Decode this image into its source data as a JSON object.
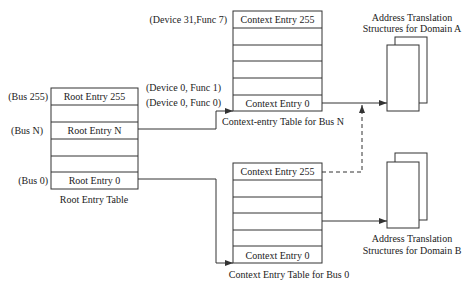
{
  "root_table": {
    "caption": "Root Entry Table",
    "entries": [
      "Root Entry 255",
      "",
      "Root Entry N",
      "",
      "",
      "Root Entry 0"
    ],
    "bus_labels": {
      "top": "(Bus 255)",
      "mid": "(Bus N)",
      "bottom": "(Bus 0)"
    }
  },
  "context_table_n": {
    "caption": "Context-entry Table for Bus N",
    "entries": [
      "Context Entry 255",
      "",
      "",
      "",
      "",
      "Context Entry 0"
    ],
    "device_labels": {
      "top": "(Device 31,Func 7)",
      "func1": "(Device 0, Func 1)",
      "func0": "(Device 0, Func 0)"
    }
  },
  "context_table_0": {
    "caption": "Context Entry Table for Bus 0",
    "entries": [
      "Context Entry 255",
      "",
      "",
      "",
      "",
      "Context Entry 0"
    ]
  },
  "domain_a": {
    "line1": "Address Translation",
    "line2": "Structures for Domain A"
  },
  "domain_b": {
    "line1": "Address Translation",
    "line2": "Structures for Domain B"
  },
  "colors": {
    "line": "#333333",
    "background": "#ffffff"
  }
}
